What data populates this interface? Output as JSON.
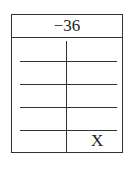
{
  "table": {
    "header": "−36",
    "rows": [
      {
        "left": "",
        "right": ""
      },
      {
        "left": "",
        "right": ""
      },
      {
        "left": "",
        "right": ""
      },
      {
        "left": "",
        "right": ""
      },
      {
        "left": "",
        "right": "X"
      }
    ]
  }
}
